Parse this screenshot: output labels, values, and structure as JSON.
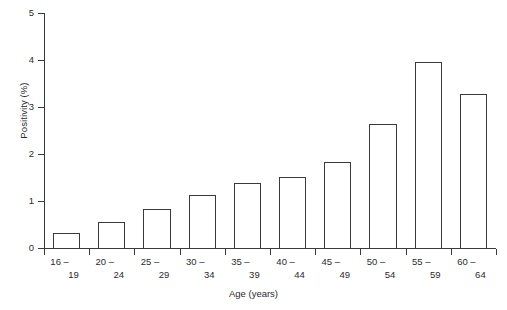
{
  "chart_data": {
    "type": "bar",
    "title": "",
    "subtitle": "",
    "xlabel": "Age (years)",
    "ylabel": "Positivity (%)",
    "categories": [
      "16 – 19",
      "20 – 24",
      "25 – 29",
      "30 – 34",
      "35 – 39",
      "40 – 44",
      "45 – 49",
      "50 – 54",
      "55 – 59",
      "60 – 64"
    ],
    "category_lines": [
      {
        "lo": "16 –",
        "hi": "19"
      },
      {
        "lo": "20 –",
        "hi": "24"
      },
      {
        "lo": "25 –",
        "hi": "29"
      },
      {
        "lo": "30 –",
        "hi": "34"
      },
      {
        "lo": "35 –",
        "hi": "39"
      },
      {
        "lo": "40 –",
        "hi": "44"
      },
      {
        "lo": "45 –",
        "hi": "49"
      },
      {
        "lo": "50 –",
        "hi": "54"
      },
      {
        "lo": "55 –",
        "hi": "59"
      },
      {
        "lo": "60 –",
        "hi": "64"
      }
    ],
    "values": [
      0.32,
      0.55,
      0.82,
      1.12,
      1.38,
      1.52,
      1.83,
      2.64,
      3.95,
      3.28
    ],
    "ylim": [
      0,
      5
    ],
    "yticks": [
      0,
      1,
      2,
      3,
      4,
      5
    ],
    "ytick_labels": [
      "0",
      "1",
      "2",
      "3",
      "4",
      "5"
    ],
    "xlim": [
      0,
      10
    ],
    "grid": false,
    "legend": null,
    "legend_position": "none",
    "bar_fill": "#ffffff",
    "bar_edge": "#3a3a3a",
    "axis_color": "#3a3a3a",
    "background": "#ffffff"
  }
}
